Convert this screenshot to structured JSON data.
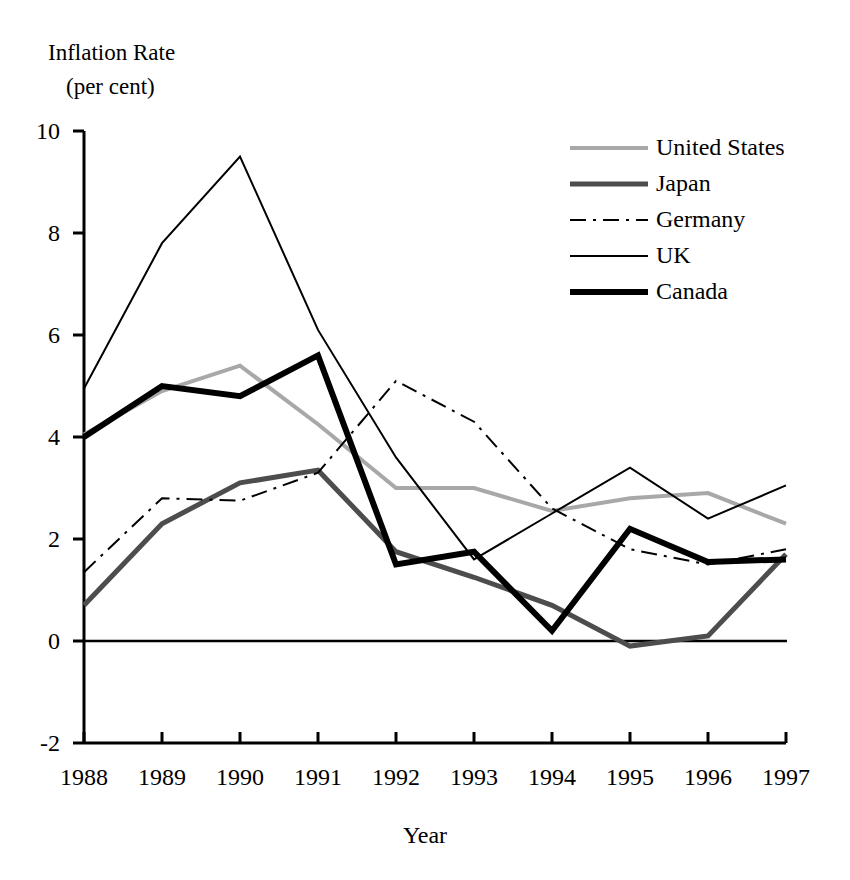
{
  "axes": {
    "y_title_line1": "Inflation Rate",
    "y_title_line2": "(per cent)",
    "x_title": "Year",
    "y_ticks": [
      "10",
      "8",
      "6",
      "4",
      "2",
      "0",
      "-2"
    ],
    "x_ticks": [
      "1988",
      "1989",
      "1990",
      "1991",
      "1992",
      "1993",
      "1994",
      "1995",
      "1996",
      "1997"
    ]
  },
  "legend": {
    "items": [
      {
        "label": "United States",
        "style": "solid-light-gray-medium",
        "color": "#a8a8a8"
      },
      {
        "label": "Japan",
        "style": "solid-dark-gray-thick",
        "color": "#4d4d4d"
      },
      {
        "label": "Germany",
        "style": "dash-dot-thin",
        "color": "#000000"
      },
      {
        "label": "UK",
        "style": "solid-black-thin",
        "color": "#000000"
      },
      {
        "label": "Canada",
        "style": "solid-black-thick",
        "color": "#000000"
      }
    ]
  },
  "chart_data": {
    "type": "line",
    "title": "",
    "xlabel": "Year",
    "ylabel": "Inflation Rate (per cent)",
    "categories": [
      1988,
      1989,
      1990,
      1991,
      1992,
      1993,
      1994,
      1995,
      1996,
      1997
    ],
    "xlim": [
      1988,
      1997
    ],
    "ylim": [
      -2,
      10
    ],
    "ytick_step": 2,
    "grid": false,
    "legend_position": "top-right",
    "zero_line": true,
    "series": [
      {
        "name": "United States",
        "color": "#a8a8a8",
        "line": "solid",
        "width": 4,
        "values": [
          4.05,
          4.9,
          5.4,
          4.25,
          3.0,
          3.0,
          2.55,
          2.8,
          2.9,
          2.3
        ]
      },
      {
        "name": "Japan",
        "color": "#4d4d4d",
        "line": "solid",
        "width": 5,
        "values": [
          0.7,
          2.3,
          3.1,
          3.35,
          1.75,
          1.25,
          0.7,
          -0.1,
          0.1,
          1.7
        ]
      },
      {
        "name": "Germany",
        "color": "#000000",
        "line": "dash-dot",
        "width": 2,
        "values": [
          1.35,
          2.8,
          2.75,
          3.3,
          5.1,
          4.3,
          2.6,
          1.8,
          1.5,
          1.8
        ]
      },
      {
        "name": "UK",
        "color": "#000000",
        "line": "solid",
        "width": 2,
        "values": [
          4.95,
          7.8,
          9.5,
          6.1,
          3.6,
          1.6,
          2.5,
          3.4,
          2.4,
          3.05
        ]
      },
      {
        "name": "Canada",
        "color": "#000000",
        "line": "solid",
        "width": 6,
        "values": [
          4.0,
          5.0,
          4.8,
          5.6,
          1.5,
          1.75,
          0.2,
          2.2,
          1.55,
          1.6
        ]
      }
    ]
  }
}
